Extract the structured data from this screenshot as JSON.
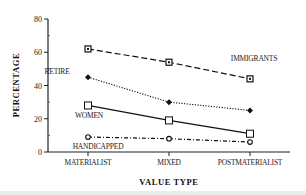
{
  "chart_data": {
    "type": "line",
    "title": "",
    "xlabel": "VALUE TYPE",
    "ylabel": "PERCENTAGE",
    "categories": [
      "MATERIALIST",
      "MIXED",
      "POSTMATERIALIST"
    ],
    "ylim": [
      0,
      80
    ],
    "yticks": [
      0,
      20,
      40,
      60,
      80
    ],
    "grid": false,
    "legend": "inline labels",
    "series": [
      {
        "name": "IMMIGRANTS",
        "values": [
          62,
          54,
          44
        ],
        "marker": "square-dot",
        "line": "dashed"
      },
      {
        "name": "RETIRE",
        "values": [
          45,
          30,
          25
        ],
        "marker": "diamond-filled",
        "line": "dotted"
      },
      {
        "name": "WOMEN",
        "values": [
          28,
          19,
          11
        ],
        "marker": "square-open",
        "line": "solid"
      },
      {
        "name": "HANDICAPPED",
        "values": [
          9,
          8,
          6
        ],
        "marker": "circle-open",
        "line": "dash-dot"
      }
    ]
  }
}
